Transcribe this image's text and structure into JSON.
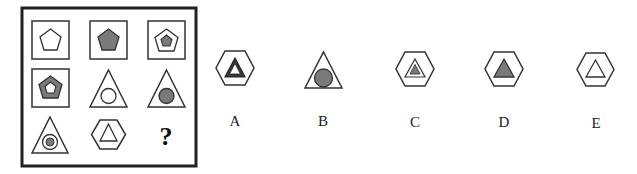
{
  "puzzle": {
    "question_mark": "?",
    "grid": [
      [
        "square with white pentagon",
        "square with gray pentagon",
        "square with white pentagon containing gray pentagon"
      ],
      [
        "square with gray pentagon containing white pentagon",
        "triangle with white circle",
        "triangle with gray circle"
      ],
      [
        "triangle with white circle containing gray circle",
        "hexagon with white triangle",
        "?"
      ]
    ],
    "colors": {
      "fill_gray": "#7a7a7a",
      "stroke": "#222222",
      "dark_fill": "#3a3a3a"
    }
  },
  "options": [
    {
      "label": "A",
      "desc": "hexagon with dark triangle containing white triangle"
    },
    {
      "label": "B",
      "desc": "triangle with gray circle"
    },
    {
      "label": "C",
      "desc": "hexagon with white triangle containing gray triangle"
    },
    {
      "label": "D",
      "desc": "hexagon with gray triangle"
    },
    {
      "label": "E",
      "desc": "hexagon with white triangle"
    }
  ]
}
